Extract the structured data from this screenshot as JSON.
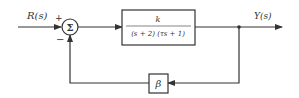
{
  "diagram": {
    "type": "feedback-control-block-diagram",
    "input_label": "R(s)",
    "output_label": "Y(s)",
    "summing_junction": {
      "symbol": "Σ",
      "plus_sign": "+",
      "minus_sign": "−"
    },
    "forward_block": {
      "numerator": "k",
      "denominator": "(s + 2) (τs + 1)"
    },
    "feedback_block": {
      "label": "β"
    },
    "colors": {
      "line": "#333333",
      "background": "#ffffff"
    }
  }
}
